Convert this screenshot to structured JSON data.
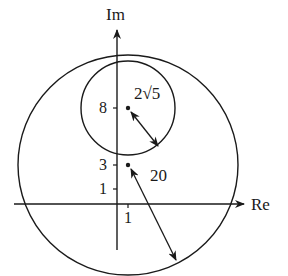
{
  "axes": {
    "x_label": "Re",
    "y_label": "Im",
    "y_ticks": [
      "8",
      "3",
      "1"
    ],
    "x_ticks": [
      "1"
    ]
  },
  "circles": [
    {
      "name": "small",
      "center": [
        1,
        8
      ],
      "radius_label": "2√5"
    },
    {
      "name": "large",
      "center": [
        1,
        3
      ],
      "radius_label": "20"
    }
  ],
  "labels": {
    "small_radius": "2√5",
    "large_radius": "20"
  },
  "colors": {
    "stroke": "#1a1a1a",
    "background": "#ffffff"
  }
}
